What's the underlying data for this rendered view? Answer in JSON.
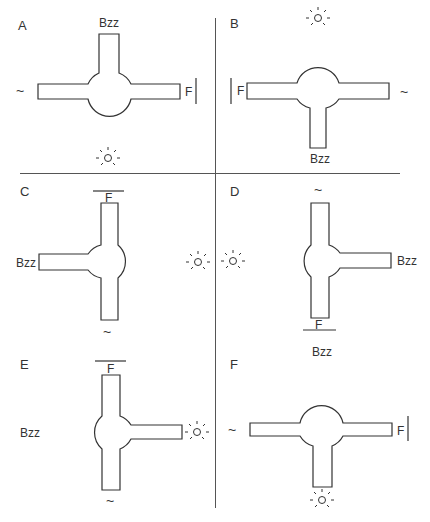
{
  "panels": [
    {
      "letter": "A",
      "bzz": "Bzz",
      "food": "F"
    },
    {
      "letter": "B",
      "bzz": "Bzz",
      "food": "F"
    },
    {
      "letter": "C",
      "bzz": "Bzz",
      "food": "F"
    },
    {
      "letter": "D",
      "bzz": "Bzz",
      "food": "F"
    },
    {
      "letter": "E",
      "bzz": "Bzz",
      "food": "F"
    },
    {
      "letter": "F",
      "bzz": "Bzz",
      "food": "F"
    }
  ],
  "icons": {
    "odor": "~",
    "light": "light-bulb"
  },
  "colors": {
    "line": "#333333",
    "divider": "#555555"
  }
}
